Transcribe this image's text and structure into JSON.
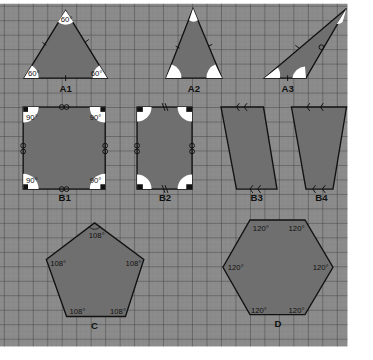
{
  "colors": {
    "paper": "#8c8c8c",
    "grid_minor": "#7a7a7a",
    "grid_major": "#3c3c3c",
    "shape_fill": "#6f6f6f",
    "shape_stroke": "#111111",
    "angle_mark": "#ffffff",
    "label_text": "#111111"
  },
  "shapes": [
    {
      "id": "A1",
      "label": "A1",
      "type": "equilateral-triangle",
      "angles": [
        "60°",
        "60°",
        "60°"
      ]
    },
    {
      "id": "A2",
      "label": "A2",
      "type": "isosceles-triangle"
    },
    {
      "id": "A3",
      "label": "A3",
      "type": "obtuse-triangle"
    },
    {
      "id": "B1",
      "label": "B1",
      "type": "square",
      "angles": [
        "90°",
        "90°",
        "90°",
        "90°"
      ]
    },
    {
      "id": "B2",
      "label": "B2",
      "type": "rectangle"
    },
    {
      "id": "B3",
      "label": "B3",
      "type": "parallelogram"
    },
    {
      "id": "B4",
      "label": "B4",
      "type": "trapezoid"
    },
    {
      "id": "C",
      "label": "C",
      "type": "regular-pentagon",
      "angles": [
        "108°",
        "108°",
        "108°",
        "108°",
        "108°"
      ]
    },
    {
      "id": "D",
      "label": "D",
      "type": "regular-hexagon",
      "angles": [
        "120°",
        "120°",
        "120°",
        "120°",
        "120°",
        "120°"
      ]
    }
  ]
}
